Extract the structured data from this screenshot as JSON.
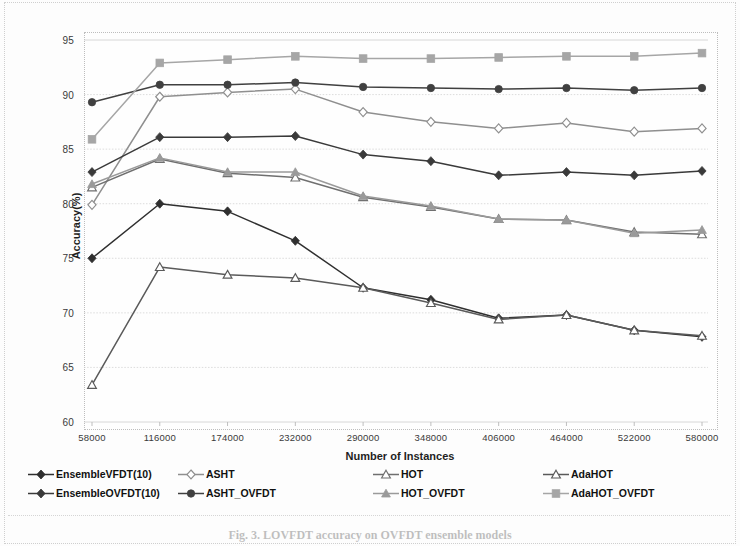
{
  "chart_data": {
    "type": "line",
    "title": "",
    "xlabel": "Number of Instances",
    "ylabel": "Accuracy(%)",
    "x": [
      58000,
      116000,
      174000,
      232000,
      290000,
      348000,
      406000,
      464000,
      522000,
      580000
    ],
    "xticklabels": [
      "58000",
      "116000",
      "174000",
      "232000",
      "290000",
      "348000",
      "406000",
      "464000",
      "522000",
      "580000"
    ],
    "yticklabels": [
      "60",
      "65",
      "70",
      "75",
      "80",
      "85",
      "90",
      "95"
    ],
    "ylim": [
      60,
      95
    ],
    "ytick_step": 5,
    "grid": true,
    "legend_position": "bottom",
    "series": [
      {
        "name": "EnsembleVFDT(10)",
        "marker": "diamond",
        "filled": true,
        "color": "#2f2f2f",
        "values": [
          75.0,
          80.0,
          79.3,
          76.6,
          72.3,
          71.2,
          69.5,
          69.8,
          68.4,
          67.8
        ]
      },
      {
        "name": "ASHT",
        "marker": "diamond",
        "filled": false,
        "color": "#8f8f8f",
        "values": [
          79.9,
          89.8,
          90.2,
          90.5,
          88.4,
          87.5,
          86.9,
          87.4,
          86.6,
          86.9
        ]
      },
      {
        "name": "HOT",
        "marker": "triangle",
        "filled": false,
        "color": "#6f6f6f",
        "values": [
          81.5,
          84.1,
          82.8,
          82.4,
          80.6,
          79.7,
          78.6,
          78.5,
          77.4,
          77.2
        ]
      },
      {
        "name": "AdaHOT",
        "marker": "triangle",
        "filled": false,
        "color": "#5a5a5a",
        "values": [
          63.4,
          74.2,
          73.5,
          73.2,
          72.3,
          70.9,
          69.4,
          69.8,
          68.4,
          67.9
        ]
      },
      {
        "name": "EnsembleOVFDT(10)",
        "marker": "diamond",
        "filled": true,
        "color": "#3a3a3a",
        "values": [
          82.9,
          86.1,
          86.1,
          86.2,
          84.5,
          83.9,
          82.6,
          82.9,
          82.6,
          83.0
        ]
      },
      {
        "name": "ASHT_OVFDT",
        "marker": "circle",
        "filled": true,
        "color": "#404040",
        "values": [
          89.3,
          90.9,
          90.9,
          91.1,
          90.7,
          90.6,
          90.5,
          90.6,
          90.4,
          90.6
        ]
      },
      {
        "name": "HOT_OVFDT",
        "marker": "triangle",
        "filled": true,
        "color": "#9a9a9a",
        "values": [
          81.8,
          84.2,
          82.9,
          82.9,
          80.7,
          79.8,
          78.6,
          78.5,
          77.3,
          77.6
        ]
      },
      {
        "name": "AdaHOT_OVFDT",
        "marker": "square",
        "filled": true,
        "color": "#a6a6a6",
        "values": [
          85.9,
          92.9,
          93.2,
          93.5,
          93.3,
          93.3,
          93.4,
          93.5,
          93.5,
          93.8
        ]
      }
    ]
  },
  "axis": {
    "ylabel": "Accuracy(%)",
    "xlabel": "Number of Instances"
  },
  "legend": {
    "row1": [
      "EnsembleVFDT(10)",
      "ASHT",
      "HOT",
      "AdaHOT"
    ],
    "row2": [
      "EnsembleOVFDT(10)",
      "ASHT_OVFDT",
      "HOT_OVFDT",
      "AdaHOT_OVFDT"
    ]
  },
  "caption": "Fig. 3. LOVFDT accuracy on OVFDT ensemble models"
}
